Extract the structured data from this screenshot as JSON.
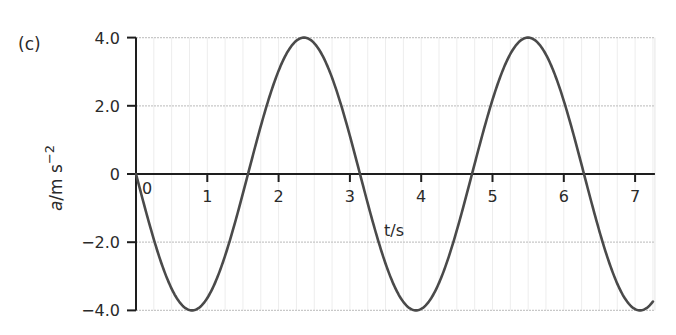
{
  "panel_label": "(c)",
  "chart_data": {
    "type": "line",
    "title": "",
    "xlabel": "t/s",
    "ylabel": "a/m s^-2",
    "ylabel_parts": {
      "var": "a",
      "unit": "/m s",
      "exp": "−2"
    },
    "xlim": [
      0,
      7.25
    ],
    "ylim": [
      -4.0,
      4.0
    ],
    "x_ticks": [
      "0",
      "1",
      "2",
      "3",
      "4",
      "5",
      "6",
      "7"
    ],
    "y_ticks": [
      "4.0",
      "2.0",
      "0",
      "−2.0",
      "−4.0"
    ],
    "y_tick_values": [
      4.0,
      2.0,
      0,
      -2.0,
      -4.0
    ],
    "grid": true,
    "legend": null,
    "series": [
      {
        "name": "a = -4 sin(2t)",
        "amplitude": 4.0,
        "angular_frequency": 2.0,
        "phase": "negative sine",
        "x": [
          0,
          0.785,
          1.571,
          2.356,
          3.142,
          3.927,
          4.712,
          5.498,
          6.283,
          7.069,
          7.25
        ],
        "values": [
          0,
          -4.0,
          0,
          4.0,
          0,
          -4.0,
          0,
          4.0,
          0,
          -4.0,
          -3.87
        ]
      }
    ]
  }
}
